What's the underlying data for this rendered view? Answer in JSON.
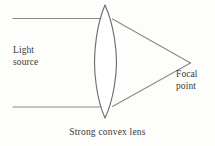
{
  "figure": {
    "background_color": "#fdfdfc",
    "line_color": "#8a8a88",
    "text_color": "#3b3a38",
    "width": 215,
    "height": 146
  },
  "labels": {
    "light_source": {
      "line1": "Light",
      "line2": "source"
    },
    "focal_point": {
      "line1": "Focal",
      "line2": "point"
    },
    "caption": "Strong convex lens"
  },
  "diagram_elements": {
    "lens_name": "strong-convex-lens",
    "incoming_ray_top": "incoming-ray-top",
    "incoming_ray_bottom": "incoming-ray-bottom",
    "converging_ray_top": "converging-ray-top",
    "converging_ray_bottom": "converging-ray-bottom"
  },
  "geometry": {
    "lens_top_tip_x": 105,
    "lens_top_tip_y": 5,
    "lens_bottom_tip_x": 105,
    "lens_bottom_tip_y": 118,
    "lens_left_bulge_x": 95,
    "lens_right_bulge_x": 117,
    "ray_top_y": 18,
    "ray_bottom_y": 107,
    "ray_start_x": 13,
    "focal_point_x": 191,
    "focal_point_y": 63
  }
}
